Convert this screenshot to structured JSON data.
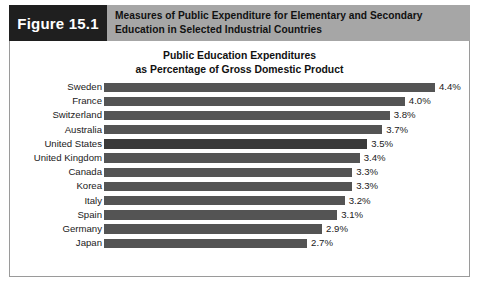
{
  "figure": {
    "tag": "Figure 15.1",
    "caption_lines": [
      "Measures of Public Expenditure for Elementary and Secondary",
      "Education in Selected Industrial Countries"
    ],
    "tag_background": "#1f1f1f",
    "band_background": "#a6a6a6"
  },
  "chart_data": {
    "type": "bar",
    "orientation": "horizontal",
    "title": "Public Education Expenditures\nas Percentage of Gross Domestic Product",
    "title_lines": [
      "Public Education Expenditures",
      "as Percentage of Gross Domestic Product"
    ],
    "xlabel": "",
    "ylabel": "",
    "grid": false,
    "legend": false,
    "axis_visible": false,
    "xlim": [
      0,
      4.8
    ],
    "value_suffix": "%",
    "bar_color": "#545454",
    "highlight_color": "#3a3a3a",
    "categories": [
      "Sweden",
      "France",
      "Switzerland",
      "Australia",
      "United States",
      "United Kingdom",
      "Canada",
      "Korea",
      "Italy",
      "Spain",
      "Germany",
      "Japan"
    ],
    "values": [
      4.4,
      4.0,
      3.8,
      3.7,
      3.5,
      3.4,
      3.3,
      3.3,
      3.2,
      3.1,
      2.9,
      2.7
    ],
    "data_labels": [
      "4.4%",
      "4.0%",
      "3.8%",
      "3.7%",
      "3.5%",
      "3.4%",
      "3.3%",
      "3.3%",
      "3.2%",
      "3.1%",
      "2.9%",
      "2.7%"
    ],
    "highlight_category": "United States"
  }
}
